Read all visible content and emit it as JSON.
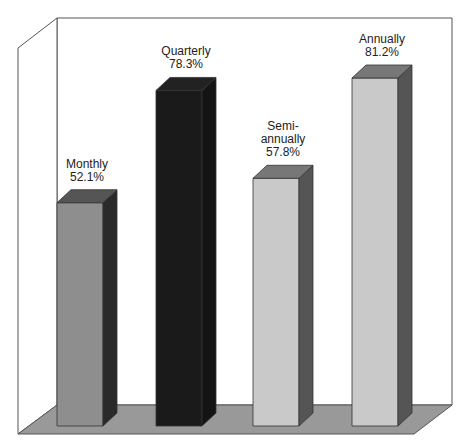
{
  "chart_data": {
    "type": "bar",
    "style": "3d",
    "title": "",
    "xlabel": "",
    "ylabel": "",
    "categories": [
      "Monthly",
      "Quarterly",
      "Semi-annually",
      "Annually"
    ],
    "values": [
      52.1,
      78.3,
      57.8,
      81.2
    ],
    "value_labels": [
      "52.1%",
      "78.3%",
      "57.8%",
      "81.2%"
    ],
    "category_labels": [
      [
        "Monthly"
      ],
      [
        "Quarterly"
      ],
      [
        "Semi-",
        "annually"
      ],
      [
        "Annually"
      ]
    ],
    "grid": false,
    "legend": null
  },
  "colors": {
    "background": "#ffffff",
    "wall_stroke": "#555555",
    "floor": "#999999",
    "bars": [
      {
        "front": "#8e8e8e",
        "side": "#2a2a2a",
        "top": "#555555"
      },
      {
        "front": "#1a1a1a",
        "side": "#141414",
        "top": "#222222"
      },
      {
        "front": "#c9c9c9",
        "side": "#555555",
        "top": "#777777"
      },
      {
        "front": "#c9c9c9",
        "side": "#555555",
        "top": "#777777"
      }
    ]
  }
}
